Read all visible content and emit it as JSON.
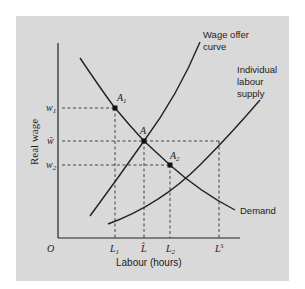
{
  "diagram": {
    "background_color": "#d9d9d9",
    "line_color": "#222222",
    "axes": {
      "y_label": "Real wage",
      "x_label": "Labour (hours)",
      "origin_label": "O"
    },
    "y_ticks": [
      {
        "label": "w",
        "sub": "1"
      },
      {
        "label": "ŵ",
        "sub": ""
      },
      {
        "label": "w",
        "sub": "2"
      }
    ],
    "x_ticks": [
      {
        "label": "L",
        "sub": "1",
        "sup": ""
      },
      {
        "label": "L̂",
        "sub": "",
        "sup": ""
      },
      {
        "label": "L",
        "sub": "2",
        "sup": ""
      },
      {
        "label": "L",
        "sub": "",
        "sup": "S"
      }
    ],
    "points": [
      {
        "label": "A",
        "sub": "1"
      },
      {
        "label": "A",
        "sub": ""
      },
      {
        "label": "A",
        "sub": "2"
      }
    ],
    "curves": {
      "wage_offer_line1": "Wage offer",
      "wage_offer_line2": "curve",
      "supply_line1": "Individual",
      "supply_line2": "labour",
      "supply_line3": "supply",
      "demand": "Demand"
    }
  }
}
